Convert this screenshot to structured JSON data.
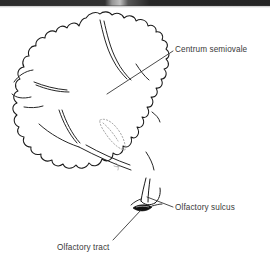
{
  "figure": {
    "kind": "anatomical-line-drawing",
    "background_color": "#ffffff",
    "ink_color": "#1a1a1a",
    "text_color": "#3a3a3a",
    "faint_ink_color": "#9a9a9a",
    "scan_band": {
      "name": "scan-edge-band",
      "color_dark": "#141414",
      "color_light": "#b9b9b9"
    }
  },
  "labels": [
    {
      "id": "centrum-semiovale",
      "text": "Centrum semiovale",
      "x": 175,
      "y": 45
    },
    {
      "id": "olfactory-sulcus",
      "text": "Olfactory sulcus",
      "x": 175,
      "y": 203
    },
    {
      "id": "olfactory-tract",
      "text": "Olfactory tract",
      "x": 57,
      "y": 243
    }
  ],
  "leader_lines": [
    {
      "id": "leader-centrum-semiovale",
      "from": [
        173,
        51
      ],
      "to": [
        107,
        94
      ]
    },
    {
      "id": "leader-olfactory-sulcus",
      "from": [
        173,
        207
      ],
      "to": [
        147,
        197
      ]
    },
    {
      "id": "leader-olfactory-tract",
      "from": [
        113,
        240
      ],
      "to": [
        141,
        210
      ]
    }
  ],
  "structures": [
    {
      "id": "cortex-outline",
      "type": "gyral-outline",
      "stroke": "#1a1a1a"
    },
    {
      "id": "lateral-ventricle",
      "type": "dotted-slit",
      "stroke": "#9a9a9a"
    },
    {
      "id": "olfactory-tract-body",
      "type": "filled-lens",
      "fill": "#101010"
    },
    {
      "id": "olfactory-sulcus-groove",
      "type": "sulcus-line",
      "stroke": "#1a1a1a"
    }
  ]
}
